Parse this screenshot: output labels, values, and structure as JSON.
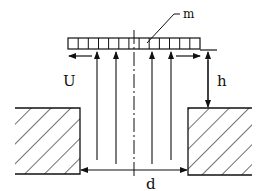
{
  "diagram": {
    "type": "engineering-schematic",
    "labels": {
      "mass": "m",
      "velocity": "U",
      "height": "h",
      "gap_width": "d"
    },
    "plate": {
      "cells": 13
    },
    "flow_arrows": {
      "count": 4,
      "direction": "up"
    },
    "outflow_arrows": [
      {
        "side": "left",
        "direction": "left"
      },
      {
        "side": "right",
        "direction": "right"
      }
    ],
    "walls": [
      {
        "side": "left",
        "hatch": "diagonal"
      },
      {
        "side": "right",
        "hatch": "diagonal"
      }
    ],
    "dimensions": [
      {
        "name": "h",
        "orientation": "vertical",
        "ends": "double-arrow"
      },
      {
        "name": "d",
        "orientation": "horizontal",
        "ends": "double-arrow"
      }
    ],
    "centerline": "dash-dot",
    "colors": {
      "stroke": "#111111",
      "background": "#ffffff"
    }
  }
}
